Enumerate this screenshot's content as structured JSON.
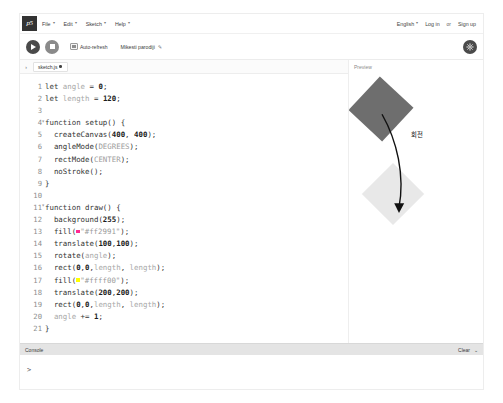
{
  "menubar": {
    "logo_text": "p5",
    "items": [
      {
        "label": "File",
        "caret": "▾"
      },
      {
        "label": "Edit",
        "caret": "▾"
      },
      {
        "label": "Sketch",
        "caret": "▾"
      },
      {
        "label": "Help",
        "caret": "▾"
      }
    ],
    "right": {
      "language": "English",
      "language_caret": "▾",
      "login": "Log in",
      "separator": "or",
      "signup": "Sign up"
    }
  },
  "toolbar": {
    "play_label": "Play",
    "stop_label": "Stop",
    "auto_refresh_label": "Auto-refresh",
    "sketch_name": "Mikesti parodiji",
    "edit_pencil": "✎",
    "settings_label": "Settings"
  },
  "filebar": {
    "chevron": "›",
    "file_name": "sketch.js",
    "unsaved_indicator": "●"
  },
  "editor": {
    "lines": [
      {
        "n": "1",
        "fold": "",
        "code": "let angle = 0;"
      },
      {
        "n": "2",
        "fold": "",
        "code": "let length = 120;"
      },
      {
        "n": "3",
        "fold": "",
        "code": ""
      },
      {
        "n": "4",
        "fold": "▾",
        "code": "function setup() {"
      },
      {
        "n": "5",
        "fold": "",
        "code": "  createCanvas(400, 400);"
      },
      {
        "n": "6",
        "fold": "",
        "code": "  angleMode(DEGREES);"
      },
      {
        "n": "7",
        "fold": "",
        "code": "  rectMode(CENTER);"
      },
      {
        "n": "8",
        "fold": "",
        "code": "  noStroke();"
      },
      {
        "n": "9",
        "fold": "",
        "code": "}"
      },
      {
        "n": "10",
        "fold": "",
        "code": ""
      },
      {
        "n": "11",
        "fold": "▾",
        "code": "function draw() {"
      },
      {
        "n": "12",
        "fold": "",
        "code": "  background(255);"
      },
      {
        "n": "13",
        "fold": "",
        "code": "  fill(\"#ff2991\");",
        "swatch": "#ff2991"
      },
      {
        "n": "14",
        "fold": "",
        "code": "  translate(100,100);"
      },
      {
        "n": "15",
        "fold": "",
        "code": "  rotate(angle);"
      },
      {
        "n": "16",
        "fold": "",
        "code": "  rect(0,0,length, length);"
      },
      {
        "n": "17",
        "fold": "",
        "code": "  fill(\"#ffff00\");",
        "swatch": "#ffff00"
      },
      {
        "n": "18",
        "fold": "",
        "code": "  translate(200,200);"
      },
      {
        "n": "19",
        "fold": "",
        "code": "  rect(0,0,length, length);"
      },
      {
        "n": "20",
        "fold": "",
        "code": "  angle += 1;"
      },
      {
        "n": "21",
        "fold": "",
        "code": "}"
      }
    ]
  },
  "preview": {
    "label": "Preview",
    "annotation_text": "회전",
    "square_rotating_color": "#6e6e6e",
    "square_second_color": "#e8e8e8"
  },
  "console": {
    "title": "Console",
    "clear_label": "Clear",
    "collapse_caret": "⌄",
    "prompt": ">"
  }
}
